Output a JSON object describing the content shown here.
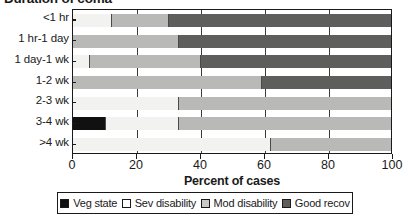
{
  "chart_data": {
    "type": "bar",
    "orientation": "horizontal",
    "stacked": true,
    "stacked_mode": "percent",
    "title": "Duration of coma",
    "xlabel": "Percent of cases",
    "ylabel": "",
    "xlim": [
      0,
      100
    ],
    "xticks": [
      0,
      20,
      40,
      60,
      80,
      100
    ],
    "xtick_labels": [
      "0",
      "20",
      "40",
      "60",
      "80",
      "100"
    ],
    "grid": true,
    "grid_axis": "x",
    "legend_position": "bottom",
    "categories": [
      "<1 hr",
      "1 hr-1 day",
      "1 day-1 wk",
      "1-2 wk",
      "2-3 wk",
      "3-4 wk",
      ">4 wk"
    ],
    "series": [
      {
        "name": "Veg state",
        "color": "#111111",
        "values": [
          0,
          0,
          0,
          0,
          0,
          10,
          0
        ]
      },
      {
        "name": "Sev disability",
        "color": "#f2f2f0",
        "values": [
          12,
          0,
          5,
          0,
          33,
          23,
          62
        ]
      },
      {
        "name": "Mod disability",
        "color": "#b9b9b7",
        "values": [
          18,
          33,
          35,
          59,
          67,
          67,
          38
        ]
      },
      {
        "name": "Good recov",
        "color": "#5e5e5c",
        "values": [
          70,
          67,
          60,
          41,
          0,
          0,
          0
        ]
      }
    ]
  },
  "legend": {
    "items": [
      {
        "label": "Veg state",
        "swatch": "veg"
      },
      {
        "label": "Sev disability",
        "swatch": "sev"
      },
      {
        "label": "Mod disability",
        "swatch": "mod"
      },
      {
        "label": "Good recov",
        "swatch": "good"
      }
    ]
  }
}
